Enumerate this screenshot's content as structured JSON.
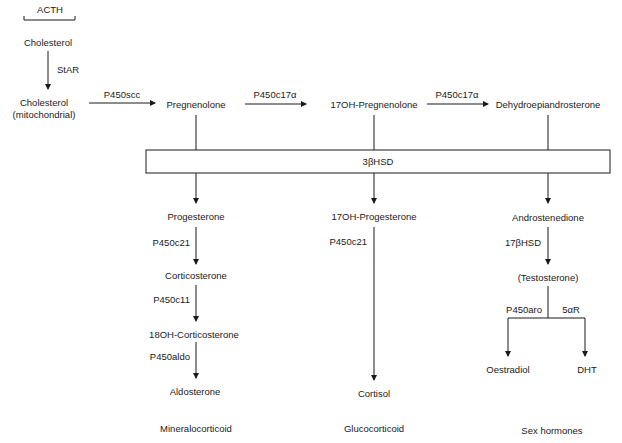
{
  "diagram": {
    "type": "steroidogenesis-pathway",
    "stimulus": "ACTH",
    "nodes": {
      "cholesterol": "Cholesterol",
      "cholesterol_mito_1": "Cholesterol",
      "cholesterol_mito_2": "(mitochondrial)",
      "pregnenolone": "Pregnenolone",
      "oh17_pregnenolone": "17OH-Pregnenolone",
      "dhea": "Dehydroepiandrosterone",
      "hsd3b": "3βHSD",
      "progesterone": "Progesterone",
      "oh17_progesterone": "17OH-Progesterone",
      "androstenedione": "Androstenedione",
      "corticosterone": "Corticosterone",
      "oh18_corticosterone": "18OH-Corticosterone",
      "aldosterone": "Aldosterone",
      "cortisol": "Cortisol",
      "testosterone": "(Testosterone)",
      "oestradiol": "Oestradiol",
      "dht": "DHT"
    },
    "enzymes": {
      "star": "StAR",
      "p450scc": "P450scc",
      "p450c17a_1": "P450c17α",
      "p450c17a_2": "P450c17α",
      "p450c21_mineral": "P450c21",
      "p450c11": "P450c11",
      "p450aldo": "P450aldo",
      "p450c21_gluco": "P450c21",
      "hsd17b": "17βHSD",
      "p450aro": "P450aro",
      "r5a": "5αR"
    },
    "categories": {
      "mineralocorticoid": "Mineralocorticoid",
      "glucocorticoid": "Glucocorticoid",
      "sex_hormones": "Sex hormones"
    }
  }
}
